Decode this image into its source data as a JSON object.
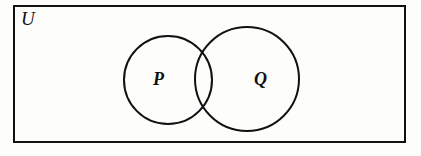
{
  "figure": {
    "type": "venn-diagram",
    "background_color": "#fdfdfc",
    "stroke_color": "#111111"
  },
  "universe": {
    "label": "U",
    "shape": "rectangle",
    "x": 14,
    "y": 6,
    "width": 391,
    "height": 136,
    "stroke_width": 2.2
  },
  "sets": [
    {
      "label": "P",
      "shape": "circle",
      "cx": 168,
      "cy": 80,
      "r": 44,
      "stroke_width": 2.0
    },
    {
      "label": "Q",
      "shape": "circle",
      "cx": 247,
      "cy": 79,
      "r": 52,
      "stroke_width": 2.0
    }
  ],
  "labels": {
    "universe": "U",
    "set_p": "P",
    "set_q": "Q"
  }
}
